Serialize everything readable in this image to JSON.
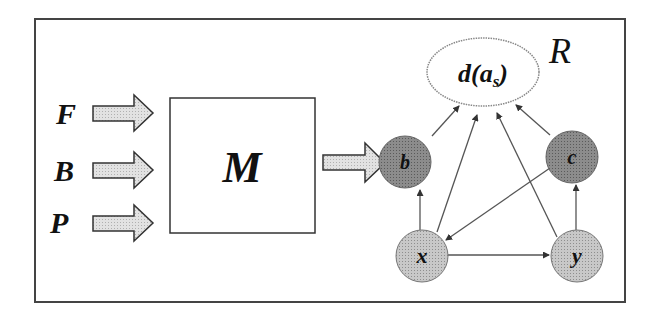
{
  "diagram": {
    "inputs": [
      {
        "label": "F",
        "y": 116
      },
      {
        "label": "B",
        "y": 172
      },
      {
        "label": "P",
        "y": 225
      }
    ],
    "model": {
      "label": "M"
    },
    "region": {
      "label": "R"
    },
    "target": {
      "label_main": "d(a",
      "label_sub": "s",
      "label_close": ")"
    },
    "nodes": [
      {
        "id": "b",
        "label": "b",
        "shade": "dark"
      },
      {
        "id": "c",
        "label": "c",
        "shade": "dark"
      },
      {
        "id": "x",
        "label": "x",
        "shade": "light"
      },
      {
        "id": "y",
        "label": "y",
        "shade": "light"
      }
    ],
    "edges": [
      {
        "from": "b",
        "to": "d(a_s)"
      },
      {
        "from": "x",
        "to": "d(a_s)"
      },
      {
        "from": "y",
        "to": "d(a_s)"
      },
      {
        "from": "c",
        "to": "d(a_s)"
      },
      {
        "from": "x",
        "to": "b"
      },
      {
        "from": "y",
        "to": "c"
      },
      {
        "from": "c",
        "to": "x"
      },
      {
        "from": "x",
        "to": "y"
      }
    ],
    "colors": {
      "frame": "#333333",
      "arrow_fill": "#dcdcdc",
      "node_dark": "#8a8a8a",
      "node_light": "#c4c4c4",
      "edge": "#555555"
    }
  }
}
